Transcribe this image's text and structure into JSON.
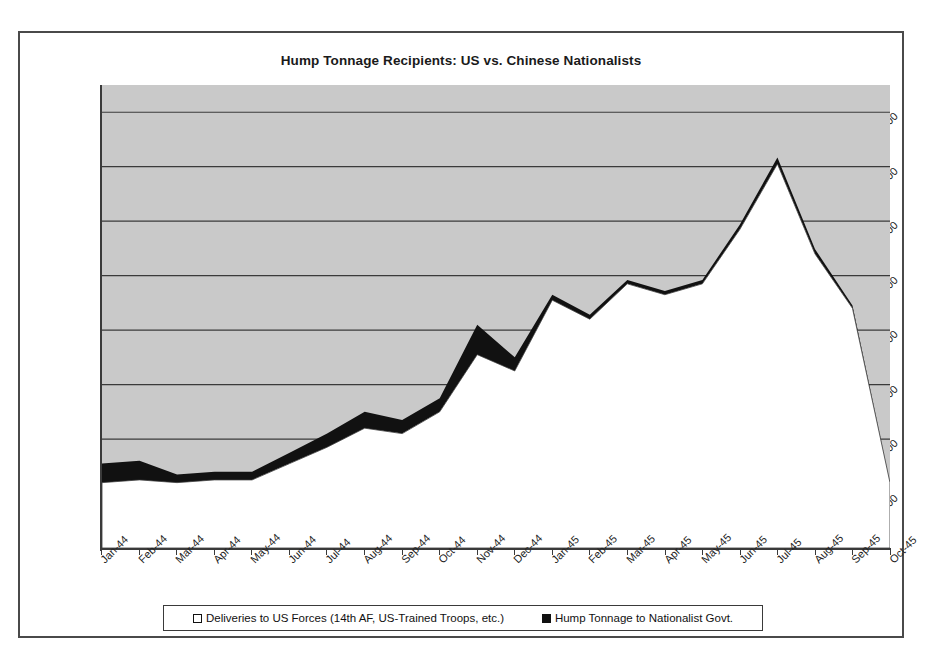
{
  "chart_data": {
    "type": "area",
    "title": "Hump Tonnage Recipients: US vs. Chinese Nationalists",
    "subtitle": "",
    "xlabel": "",
    "ylabel": "",
    "stacked": true,
    "grid": true,
    "legend_position": "bottom",
    "ylim": [
      0,
      85000
    ],
    "y_ticks": [
      "10,000",
      "20,000",
      "30,000",
      "40,000",
      "50,000",
      "60,000",
      "70,000",
      "80,000"
    ],
    "y_tick_values": [
      10000,
      20000,
      30000,
      40000,
      50000,
      60000,
      70000,
      80000
    ],
    "categories": [
      "Jan-44",
      "Feb-44",
      "Mar-44",
      "Apr-44",
      "May-44",
      "Jun-44",
      "Jul-44",
      "Aug-44",
      "Sep-44",
      "Oct-44",
      "Nov-44",
      "Dec-44",
      "Jan-45",
      "Feb-45",
      "Mar-45",
      "Apr-45",
      "May-45",
      "Jun-45",
      "Jul-45",
      "Aug-45",
      "Sep-45",
      "Oct-45"
    ],
    "series": [
      {
        "name": "Deliveries to US Forces (14th AF, US-Trained Troops, etc.)",
        "color": "#ffffff",
        "values": [
          12000,
          12500,
          12000,
          12500,
          12500,
          15500,
          18500,
          22000,
          21000,
          25000,
          35500,
          32500,
          45500,
          42000,
          48500,
          46500,
          48500,
          58500,
          70500,
          54000,
          44000,
          12000
        ]
      },
      {
        "name": "Hump Tonnage to Nationalist Govt.",
        "color": "#111111",
        "values": [
          3500,
          3500,
          1500,
          1500,
          1500,
          2000,
          2500,
          3000,
          2500,
          2500,
          5500,
          2500,
          1000,
          800,
          700,
          700,
          700,
          900,
          1200,
          900,
          500,
          0
        ]
      }
    ],
    "totals": [
      15500,
      16000,
      13500,
      14000,
      14000,
      17500,
      21000,
      25000,
      23500,
      27500,
      41000,
      35000,
      46500,
      42800,
      49200,
      47200,
      49200,
      59400,
      71700,
      54900,
      44500,
      12000
    ]
  },
  "legend": {
    "entries": [
      {
        "label": "Deliveries to US Forces (14th AF, US-Trained Troops, etc.)",
        "swatch": "open"
      },
      {
        "label": "Hump Tonnage to Nationalist Govt.",
        "swatch": "filled"
      }
    ]
  },
  "colors": {
    "plot_background": "#c9c9c9",
    "upper_series": "#111111",
    "lower_series": "#ffffff",
    "axis": "#3a3a3a",
    "frame": "#4a4a4a",
    "text": "#1a1a1a"
  }
}
